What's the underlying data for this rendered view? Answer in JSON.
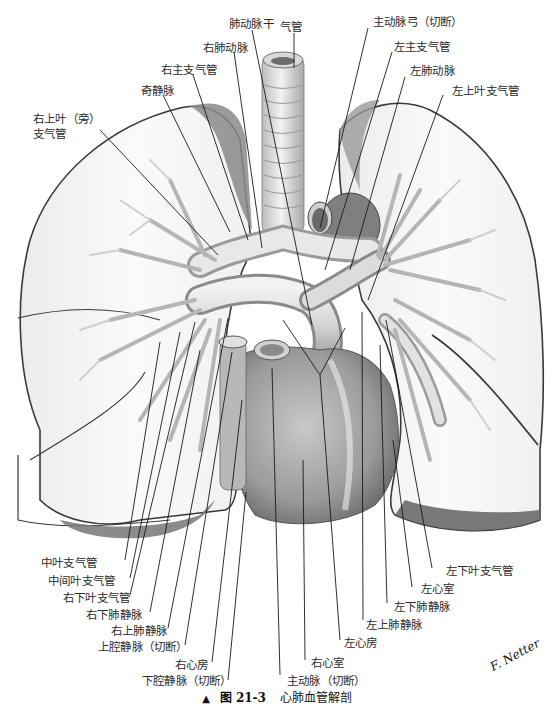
{
  "figure": {
    "caption": {
      "marker": "▲",
      "figure_label": "图 21-3",
      "title": "心肺血管解剖"
    },
    "signature": "F. Netter",
    "colors": {
      "lung_fill": "#f4f4f4",
      "lung_outline": "#3a3a3a",
      "lung_shadow": "#8a8a8a",
      "vessel_light": "#e6e6e6",
      "vessel_mid": "#bdbdbd",
      "vessel_dark": "#6e6e6e",
      "heart": "#a9a9a9",
      "heart_dark": "#7a7a7a",
      "leader_line": "#1a1a1a",
      "label_text": "#2b2b2b"
    },
    "labels": {
      "top": [
        {
          "id": "trachea",
          "text": "气管"
        },
        {
          "id": "pulmonary-trunk",
          "text": "肺动脉干"
        },
        {
          "id": "right-pulmonary-artery",
          "text": "右肺动脉"
        },
        {
          "id": "right-main-bronchus",
          "text": "右主支气管"
        },
        {
          "id": "azygos-vein",
          "text": "奇静脉"
        },
        {
          "id": "right-upper-lobe-bronchus",
          "text": "右上叶（旁）\n支气管"
        },
        {
          "id": "aortic-arch",
          "text": "主动脉弓（切断）"
        },
        {
          "id": "left-main-bronchus",
          "text": "左主支气管"
        },
        {
          "id": "left-pulmonary-artery",
          "text": "左肺动脉"
        },
        {
          "id": "left-upper-lobe-bronchus",
          "text": "左上叶支气管"
        }
      ],
      "bottom_left": [
        {
          "id": "middle-lobe-bronchus",
          "text": "中叶支气管"
        },
        {
          "id": "intermediate-bronchus",
          "text": "中间叶支气管"
        },
        {
          "id": "right-lower-lobe-bronchus",
          "text": "右下叶支气管"
        },
        {
          "id": "right-inferior-pulmonary-vein",
          "text": "右下肺静脉"
        },
        {
          "id": "right-superior-pulmonary-vein",
          "text": "右上肺静脉"
        },
        {
          "id": "superior-vena-cava",
          "text": "上腔静脉（切断）"
        },
        {
          "id": "right-atrium",
          "text": "右心房"
        },
        {
          "id": "inferior-vena-cava",
          "text": "下腔静脉（切断）"
        }
      ],
      "bottom_right": [
        {
          "id": "aorta",
          "text": "主动脉（切断）"
        },
        {
          "id": "right-ventricle",
          "text": "右心室"
        },
        {
          "id": "left-atrium",
          "text": "左心房"
        },
        {
          "id": "left-superior-pulmonary-vein",
          "text": "左上肺静脉"
        },
        {
          "id": "left-inferior-pulmonary-vein",
          "text": "左下肺静脉"
        },
        {
          "id": "left-ventricle",
          "text": "左心室"
        },
        {
          "id": "left-lower-lobe-bronchus",
          "text": "左下叶支气管"
        }
      ]
    }
  }
}
